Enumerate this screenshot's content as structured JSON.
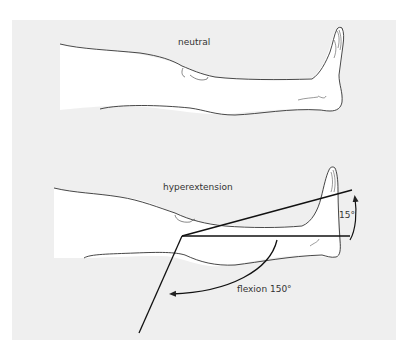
{
  "figure": {
    "panel_color": "#efefef",
    "line_color": "#333333",
    "views": [
      {
        "id": "neutral",
        "label": "neutral"
      },
      {
        "id": "hyperextension",
        "label": "hyperextension"
      }
    ],
    "angles": {
      "hyperextension": {
        "label": "15°",
        "value_degrees": 15
      },
      "flexion": {
        "label": "flexion 150°",
        "value_degrees": 150
      }
    }
  }
}
